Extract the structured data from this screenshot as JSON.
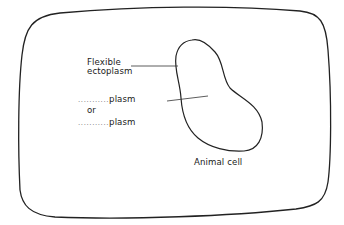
{
  "diagram": {
    "labels": {
      "flexible_line1": "Flexible",
      "flexible_line2": "ectoplasm",
      "blank1_dots": "...........",
      "blank1_suffix": "plasm",
      "or": "or",
      "blank2_dots": "...........",
      "blank2_suffix": "plasm",
      "caption": "Animal cell"
    },
    "colors": {
      "stroke": "#222222",
      "background": "#ffffff"
    }
  }
}
